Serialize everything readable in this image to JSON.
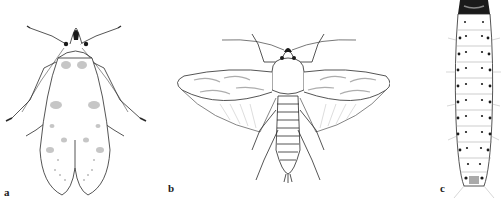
{
  "figure": {
    "panels": [
      {
        "id": "a",
        "label": "a",
        "subject": "adult moth, wings folded (dorsal view)"
      },
      {
        "id": "b",
        "label": "b",
        "subject": "adult moth, wings spread (dorsal view)"
      },
      {
        "id": "c",
        "label": "c",
        "subject": "larva (dorsal view)"
      }
    ],
    "colors": {
      "background": "#ffffff",
      "line": "#2a2a2a",
      "shade": "#b8b8b8",
      "dark": "#1a1a1a"
    }
  }
}
